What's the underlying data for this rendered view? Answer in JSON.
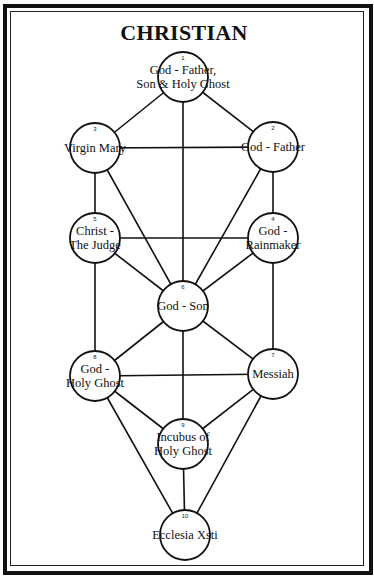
{
  "title": "CHRISTIAN",
  "nodes": [
    {
      "id": "1",
      "number": "1",
      "lines": [
        "God - Father,",
        "Son & Holy Ghost"
      ],
      "cx": 183,
      "cy": 77
    },
    {
      "id": "2",
      "number": "2",
      "lines": [
        "God - Father"
      ],
      "cx": 273,
      "cy": 147
    },
    {
      "id": "3",
      "number": "3",
      "lines": [
        "Virgin Mary"
      ],
      "cx": 95,
      "cy": 148
    },
    {
      "id": "4",
      "number": "4",
      "lines": [
        "God -",
        "Rainmaker"
      ],
      "cx": 273,
      "cy": 238
    },
    {
      "id": "5",
      "number": "5",
      "lines": [
        "Christ -",
        "The Judge"
      ],
      "cx": 95,
      "cy": 238
    },
    {
      "id": "6",
      "number": "6",
      "lines": [
        "God - Son"
      ],
      "cx": 183,
      "cy": 306
    },
    {
      "id": "7",
      "number": "7",
      "lines": [
        "Messiah"
      ],
      "cx": 273,
      "cy": 374
    },
    {
      "id": "8",
      "number": "8",
      "lines": [
        "God -",
        "Holy Ghost"
      ],
      "cx": 95,
      "cy": 376
    },
    {
      "id": "9",
      "number": "9",
      "lines": [
        "Incubus of",
        "Holy Ghost"
      ],
      "cx": 183,
      "cy": 444
    },
    {
      "id": "10",
      "number": "10",
      "lines": [
        "Ecclesia Xsti"
      ],
      "cx": 185,
      "cy": 535
    }
  ],
  "edges": [
    [
      "1",
      "2"
    ],
    [
      "1",
      "3"
    ],
    [
      "1",
      "6"
    ],
    [
      "2",
      "3"
    ],
    [
      "2",
      "4"
    ],
    [
      "2",
      "6"
    ],
    [
      "3",
      "5"
    ],
    [
      "3",
      "6"
    ],
    [
      "4",
      "5"
    ],
    [
      "4",
      "6"
    ],
    [
      "4",
      "7"
    ],
    [
      "5",
      "6"
    ],
    [
      "5",
      "8"
    ],
    [
      "6",
      "7"
    ],
    [
      "6",
      "8"
    ],
    [
      "6",
      "9"
    ],
    [
      "7",
      "8"
    ],
    [
      "7",
      "9"
    ],
    [
      "7",
      "10"
    ],
    [
      "8",
      "9"
    ],
    [
      "8",
      "10"
    ],
    [
      "9",
      "10"
    ]
  ],
  "style": {
    "line_color": "#111111",
    "background": "#ffffff",
    "node_radius": 25
  }
}
